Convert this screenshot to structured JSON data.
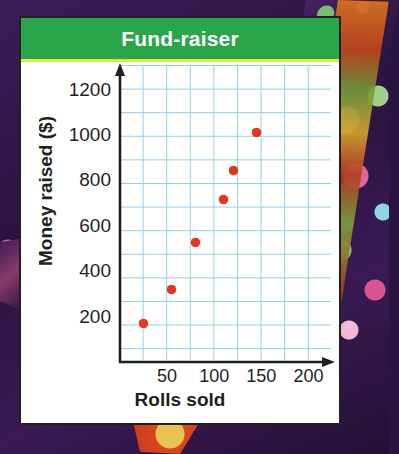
{
  "card": {
    "title": "Fund-raiser",
    "banner_color": "#2aa64a",
    "banner_accent_color": "#e9e73d",
    "border_color": "#231f20",
    "background_color": "#ffffff"
  },
  "chart_data": {
    "type": "scatter",
    "title": "Fund-raiser",
    "xlabel": "Rolls sold",
    "ylabel": "Money raised ($)",
    "xlim": [
      0,
      225
    ],
    "ylim": [
      0,
      1300
    ],
    "xticks": [
      50,
      100,
      150,
      200
    ],
    "yticks": [
      200,
      400,
      600,
      800,
      1000,
      1200
    ],
    "grid": true,
    "grid_color": "#8fcfe8",
    "grid_step_x": 25,
    "grid_step_y": 100,
    "legend": "none",
    "point_color": "#e8341c",
    "x": [
      25,
      55,
      80,
      110,
      120,
      145
    ],
    "y": [
      170,
      320,
      525,
      715,
      845,
      1010
    ],
    "points": [
      {
        "x": 25,
        "y": 170
      },
      {
        "x": 55,
        "y": 320
      },
      {
        "x": 80,
        "y": 525
      },
      {
        "x": 110,
        "y": 715
      },
      {
        "x": 120,
        "y": 845
      },
      {
        "x": 145,
        "y": 1010
      }
    ]
  },
  "axis": {
    "x_tick_labels": [
      "50",
      "100",
      "150",
      "200"
    ],
    "y_tick_labels": [
      "1200",
      "1000",
      "800",
      "600",
      "400",
      "200"
    ],
    "x_title": "Rolls sold",
    "y_title": "Money raised ($)",
    "axis_color": "#231f20"
  }
}
